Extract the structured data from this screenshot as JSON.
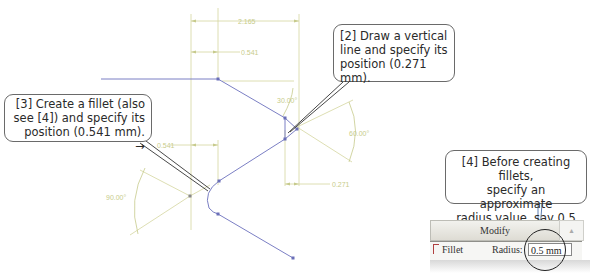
{
  "callouts": {
    "step2": {
      "lines": [
        "[2] Draw a vertical",
        "line and specify its",
        "position (0.271 mm)."
      ]
    },
    "step3": {
      "lines": [
        "[3] Create a fillet (also",
        "see [4]) and specify its",
        "position (0.541 mm). →"
      ]
    },
    "step4": {
      "lines": [
        "[4] Before creating fillets,",
        "specify an approximate",
        "radius value, say 0.5 mm. #"
      ]
    }
  },
  "dimensions": {
    "overall_width": "2.165",
    "offset_top": "0.541",
    "offset_left": "0.541",
    "offset_bottom": "0.271",
    "angle_30": "30.00°",
    "angle_60": "60.00°",
    "angle_90": "90.00°"
  },
  "modify_panel": {
    "header": "Modify",
    "fillet_label": "Fillet",
    "radius_label": "Radius:",
    "radius_value": "0.5 mm",
    "scroll_glyph": "▴"
  },
  "colors": {
    "geometry": "#7b7fc4",
    "dimension": "#d4d6a0",
    "leader": "#333333",
    "callout_border": "#6a6a6a"
  }
}
